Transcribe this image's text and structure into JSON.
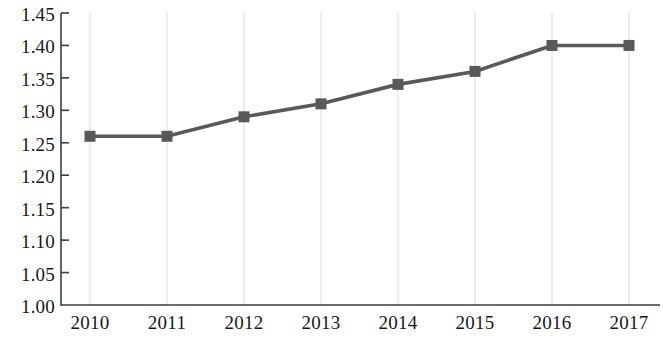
{
  "chart_data": {
    "type": "line",
    "title": "",
    "subtitle": "",
    "xlabel": "",
    "ylabel": "",
    "categories": [
      "2010",
      "2011",
      "2012",
      "2013",
      "2014",
      "2015",
      "2016",
      "2017"
    ],
    "values": [
      1.26,
      1.26,
      1.29,
      1.31,
      1.34,
      1.36,
      1.4,
      1.4
    ],
    "series": [
      {
        "name": "series-1",
        "values": [
          1.26,
          1.26,
          1.29,
          1.31,
          1.34,
          1.36,
          1.4,
          1.4
        ]
      }
    ],
    "ylim": [
      1.0,
      1.45
    ],
    "ytick_step": 0.05,
    "ytick_labels": [
      "1.45",
      "1.40",
      "1.35",
      "1.30",
      "1.25",
      "1.20",
      "1.15",
      "1.10",
      "1.05",
      "1.00"
    ],
    "ytick_values": [
      1.45,
      1.4,
      1.35,
      1.3,
      1.25,
      1.2,
      1.15,
      1.1,
      1.05,
      1.0
    ],
    "xtick_labels": [
      "2010",
      "2011",
      "2012",
      "2013",
      "2014",
      "2015",
      "2016",
      "2017"
    ],
    "grid": {
      "vertical": true,
      "horizontal": false,
      "color": "#d9d9d9"
    },
    "legend": {
      "visible": false,
      "position": "none",
      "entries": []
    },
    "annotations": [],
    "style": {
      "line_color": "#595959",
      "marker_color": "#595959",
      "marker_shape": "square",
      "axis_color": "#3d3d3d",
      "background": "#ffffff"
    }
  }
}
